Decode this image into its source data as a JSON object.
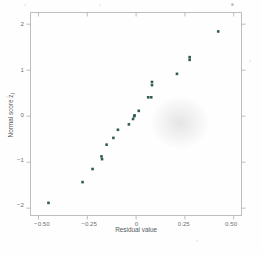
{
  "figure": {
    "background_color": "#fefefe",
    "marker_color": "#2f5d56",
    "axis_color": "#a9adb0",
    "label_color": "#6e7376"
  },
  "chart_data": {
    "type": "scatter",
    "title": "",
    "xlabel": "Residual value",
    "ylabel": "Normal score z",
    "ylabel_subscript": "j",
    "xlim": [
      -0.56,
      0.555
    ],
    "ylim": [
      -2.24,
      2.26
    ],
    "grid": false,
    "legend": null,
    "xticks": [
      -0.5,
      -0.25,
      0,
      0.25,
      0.5
    ],
    "xticklabels": [
      "-0.50",
      "-0.25",
      "0",
      "0.25",
      "0.50"
    ],
    "yticks": [
      -2,
      -1,
      0,
      1,
      2
    ],
    "yticklabels": [
      "-2",
      "-1",
      "0",
      "1",
      "2"
    ],
    "points": [
      {
        "x": -0.465,
        "y": -1.96
      },
      {
        "x": -0.285,
        "y": -1.5
      },
      {
        "x": -0.232,
        "y": -1.21
      },
      {
        "x": -0.185,
        "y": -0.93
      },
      {
        "x": -0.182,
        "y": -0.99
      },
      {
        "x": -0.158,
        "y": -0.67
      },
      {
        "x": -0.122,
        "y": -0.52
      },
      {
        "x": -0.098,
        "y": -0.34
      },
      {
        "x": -0.04,
        "y": -0.22
      },
      {
        "x": -0.018,
        "y": -0.1
      },
      {
        "x": -0.012,
        "y": -0.04
      },
      {
        "x": -0.01,
        "y": -0.02
      },
      {
        "x": 0.012,
        "y": 0.08
      },
      {
        "x": 0.062,
        "y": 0.38
      },
      {
        "x": 0.078,
        "y": 0.38
      },
      {
        "x": 0.082,
        "y": 0.65
      },
      {
        "x": 0.082,
        "y": 0.72
      },
      {
        "x": 0.214,
        "y": 0.9
      },
      {
        "x": 0.281,
        "y": 1.21
      },
      {
        "x": 0.281,
        "y": 1.27
      },
      {
        "x": 0.432,
        "y": 1.84
      }
    ]
  }
}
